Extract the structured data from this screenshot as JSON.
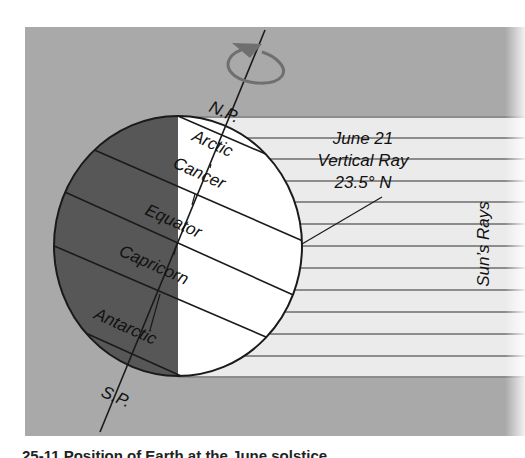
{
  "figure": {
    "type": "diagram",
    "colors": {
      "panel_background": "#a9a9a9",
      "rays_band": "#ebebeb",
      "ray_lines": "#8c8c8c",
      "night_side": "#575757",
      "day_side": "#ffffff",
      "outline": "#1a1a1a",
      "rotation_arrow": "#6f6f6f"
    },
    "labels": {
      "north_pole": "N.P.",
      "south_pole": "S.P.",
      "arctic": "Arctic",
      "cancer": "Cancer",
      "equator": "Equator",
      "capricorn": "Capricorn",
      "antarctic": "Antarctic",
      "callout_line1": "June 21",
      "callout_line2": "Vertical Ray",
      "callout_line3": "23.5° N",
      "rays": "Sun’s Rays"
    },
    "caption": "25-11   Position of Earth at the June solstice"
  }
}
